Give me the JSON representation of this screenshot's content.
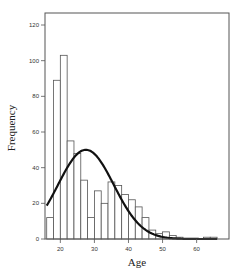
{
  "chart_data": {
    "type": "bar",
    "subtype": "histogram_with_normal_curve",
    "title": "",
    "xlabel": "Age",
    "ylabel": "Frequency",
    "xlim": [
      15.5,
      69.5
    ],
    "ylim": [
      0,
      120
    ],
    "x_ticks": [
      20,
      30,
      40,
      50,
      60
    ],
    "y_ticks": [
      0,
      20,
      40,
      60,
      80,
      100,
      120
    ],
    "bin_width": 2,
    "bins": [
      {
        "start": 16,
        "end": 18,
        "count": 12
      },
      {
        "start": 18,
        "end": 20,
        "count": 89
      },
      {
        "start": 20,
        "end": 22,
        "count": 103
      },
      {
        "start": 22,
        "end": 24,
        "count": 55
      },
      {
        "start": 24,
        "end": 26,
        "count": 48
      },
      {
        "start": 26,
        "end": 28,
        "count": 33
      },
      {
        "start": 28,
        "end": 30,
        "count": 12
      },
      {
        "start": 30,
        "end": 32,
        "count": 27
      },
      {
        "start": 32,
        "end": 34,
        "count": 20
      },
      {
        "start": 34,
        "end": 36,
        "count": 32
      },
      {
        "start": 36,
        "end": 38,
        "count": 30
      },
      {
        "start": 38,
        "end": 40,
        "count": 25
      },
      {
        "start": 40,
        "end": 42,
        "count": 22
      },
      {
        "start": 42,
        "end": 44,
        "count": 18
      },
      {
        "start": 44,
        "end": 46,
        "count": 12
      },
      {
        "start": 46,
        "end": 48,
        "count": 5
      },
      {
        "start": 48,
        "end": 50,
        "count": 3
      },
      {
        "start": 50,
        "end": 52,
        "count": 4
      },
      {
        "start": 52,
        "end": 54,
        "count": 2
      },
      {
        "start": 54,
        "end": 56,
        "count": 1
      },
      {
        "start": 56,
        "end": 58,
        "count": 0
      },
      {
        "start": 58,
        "end": 60,
        "count": 0
      },
      {
        "start": 60,
        "end": 62,
        "count": 0
      },
      {
        "start": 62,
        "end": 64,
        "count": 1
      },
      {
        "start": 64,
        "end": 66,
        "count": 1
      }
    ],
    "normal_curve": {
      "mean": 27.5,
      "sd": 8.2,
      "peak": 50,
      "x_range": [
        16,
        66
      ]
    },
    "grid": false,
    "legend": null
  },
  "style": {
    "bar_fill": "#ffffff",
    "bar_stroke": "#555555",
    "curve_color": "#111111",
    "axis_color": "#555555"
  }
}
